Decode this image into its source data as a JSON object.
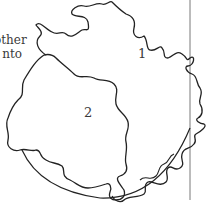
{
  "diagram": {
    "side_text": {
      "line1": "other",
      "line2": "nto"
    },
    "regions": [
      {
        "id": "region-1",
        "label": "1"
      },
      {
        "id": "region-2",
        "label": "2"
      }
    ],
    "colors": {
      "stroke": "#222222",
      "text": "#3a3a3a",
      "background": "#ffffff"
    }
  }
}
